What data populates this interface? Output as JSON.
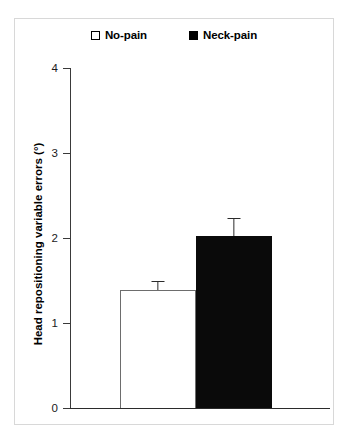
{
  "chart_data": {
    "type": "bar",
    "title": "",
    "xlabel": "",
    "ylabel": "Head repositioning variable errors (°)",
    "categories": [
      "No-pain",
      "Neck-pain"
    ],
    "values": [
      1.39,
      2.02
    ],
    "errors": [
      0.11,
      0.22
    ],
    "error_type": "standard error",
    "ylim": [
      0,
      4
    ],
    "ytick_labels": [
      "0",
      "1",
      "2",
      "3",
      "4"
    ],
    "ytick_values": [
      0,
      1,
      2,
      3,
      4
    ],
    "grid": false,
    "legend_position": "top-center",
    "series": [
      {
        "name": "No-pain",
        "value": 1.39,
        "error": 0.11,
        "fill": "#ffffff",
        "edge": "#6d6d6d"
      },
      {
        "name": "Neck-pain",
        "value": 2.02,
        "error": 0.22,
        "fill": "#0a0a0a",
        "edge": "#0a0a0a"
      }
    ]
  },
  "legend": {
    "entries": [
      {
        "label": "No-pain",
        "marker": "hollow-square-icon"
      },
      {
        "label": "Neck-pain",
        "marker": "filled-square-icon"
      }
    ]
  },
  "axis": {
    "y_title": "Head repositioning variable errors (°)",
    "ticks": [
      {
        "label": "4",
        "value": 4
      },
      {
        "label": "3",
        "value": 3
      },
      {
        "label": "2",
        "value": 2
      },
      {
        "label": "1",
        "value": 1
      },
      {
        "label": "0",
        "value": 0
      }
    ]
  },
  "colors": {
    "no_pain_fill": "#ffffff",
    "neck_pain_fill": "#0a0a0a",
    "axis": "#2b2b2b",
    "frame": "#d8d8d8"
  }
}
